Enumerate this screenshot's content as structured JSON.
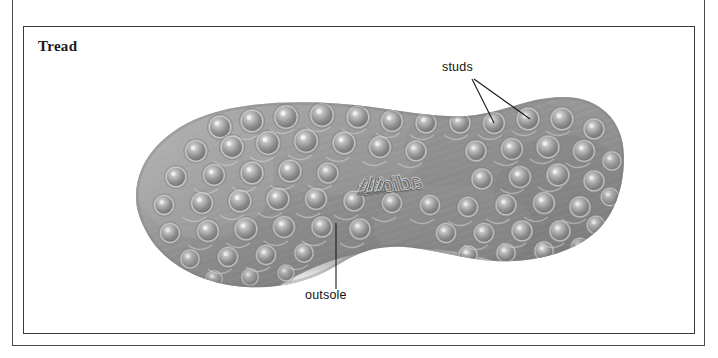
{
  "figure": {
    "title": "Tread",
    "brand_mark": "adidas"
  },
  "annotations": [
    {
      "id": "studs",
      "label": "studs",
      "leader_count": 2,
      "points_to": "two raised circular studs on the forefoot area"
    },
    {
      "id": "outsole",
      "label": "outsole",
      "leader_count": 1,
      "points_to": "the rubber outsole body near the arch"
    }
  ],
  "colors": {
    "frame_outer": "#4a4a4a",
    "frame_inner": "#3a3a3a",
    "title_text": "#1b1b1b",
    "label_text": "#111111",
    "leader_line": "#1a1a1a",
    "page_background": "#ffffff",
    "sole_mid": "#9a9a9a",
    "sole_dark": "#6f6f6f",
    "sole_light": "#c7c7c7",
    "stud_highlight": "#ededed"
  }
}
